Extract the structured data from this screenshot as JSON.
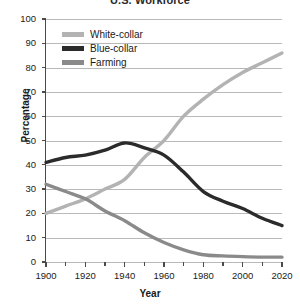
{
  "chart_data": {
    "type": "line",
    "title": "U.S. Workforce",
    "xlabel": "Year",
    "ylabel": "Percentage",
    "xlim": [
      1900,
      2020
    ],
    "ylim": [
      0,
      100
    ],
    "grid": true,
    "legend_position": "upper-left-inside",
    "x": [
      1900,
      1910,
      1920,
      1930,
      1940,
      1950,
      1960,
      1970,
      1980,
      1990,
      2000,
      2010,
      2020
    ],
    "xticks": [
      "1900",
      "1920",
      "1940",
      "1960",
      "1980",
      "2000",
      "2020"
    ],
    "yticks": [
      "0",
      "10",
      "20",
      "30",
      "40",
      "50",
      "60",
      "70",
      "80",
      "90",
      "100"
    ],
    "series": [
      {
        "name": "White-collar",
        "color": "#b3b3b3",
        "values": [
          20,
          23,
          26,
          30,
          34,
          43,
          50,
          60,
          67,
          73,
          78,
          82,
          86
        ]
      },
      {
        "name": "Blue-collar",
        "color": "#2b2b2b",
        "values": [
          41,
          43,
          44,
          46,
          49,
          47,
          44,
          37,
          29,
          25,
          22,
          18,
          15
        ]
      },
      {
        "name": "Farming",
        "color": "#8a8a8a",
        "values": [
          32,
          29,
          26,
          21,
          17,
          12,
          8,
          5,
          3,
          2.5,
          2.2,
          2,
          2
        ]
      }
    ]
  },
  "legend": {
    "items": [
      {
        "label": "White-collar"
      },
      {
        "label": "Blue-collar"
      },
      {
        "label": "Farming"
      }
    ]
  }
}
